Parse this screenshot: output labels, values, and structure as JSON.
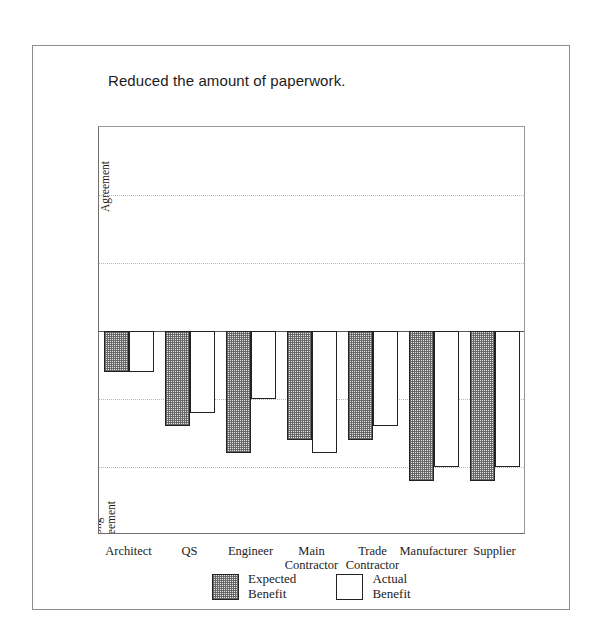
{
  "chart_data": {
    "type": "bar",
    "title": "Reduced the amount of paperwork.",
    "xlabel": "",
    "ylabel": "",
    "ylim": [
      -3,
      3
    ],
    "ytick_values": [
      3,
      2,
      1,
      0,
      -1,
      -2,
      -3
    ],
    "ytick_labels": [
      "3",
      "2",
      "1",
      "0",
      "-1",
      "-2",
      "-3"
    ],
    "yminor_step": 0.5,
    "grid": "horizontal dotted at -2, -1, 1, 2; solid zero line",
    "axis_anchor_labels": [
      {
        "value": 2.5,
        "lines": [
          "Strong",
          "Agreement"
        ]
      },
      {
        "value": 0,
        "lines": [
          "Neutral"
        ]
      },
      {
        "value": -2.5,
        "lines": [
          "Strong",
          "Disagreement"
        ]
      }
    ],
    "categories": [
      {
        "lines": [
          "Architect"
        ]
      },
      {
        "lines": [
          "QS"
        ]
      },
      {
        "lines": [
          "Engineer"
        ]
      },
      {
        "lines": [
          "Main",
          "Contractor"
        ]
      },
      {
        "lines": [
          "Trade",
          "Contractor"
        ]
      },
      {
        "lines": [
          "Manufacturer"
        ]
      },
      {
        "lines": [
          "Supplier"
        ]
      }
    ],
    "series": [
      {
        "name": "Expected Benefit",
        "legend_lines": [
          "Expected",
          "Benefit"
        ],
        "style": "hatched",
        "values": [
          -0.6,
          -1.4,
          -1.8,
          -1.6,
          -1.6,
          -2.2,
          -2.2
        ]
      },
      {
        "name": "Actual Benefit",
        "legend_lines": [
          "Actual",
          "Benefit"
        ],
        "style": "open",
        "values": [
          -0.6,
          -1.2,
          -1.0,
          -1.8,
          -1.4,
          -2.0,
          -2.0
        ]
      }
    ],
    "legend_position": "bottom-center"
  }
}
